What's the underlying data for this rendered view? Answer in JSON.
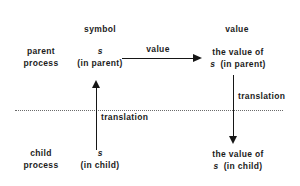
{
  "diagram": {
    "columns": {
      "symbol_header": "symbol",
      "value_header": "value"
    },
    "rows": {
      "parent_label_line1": "parent",
      "parent_label_line2": "process",
      "child_label_line1": "child",
      "child_label_line2": "process"
    },
    "nodes": {
      "parent_symbol_name": "s",
      "parent_symbol_scope": "(in parent)",
      "parent_value_line1": "the value of",
      "parent_value_name": "s",
      "parent_value_scope": "(in parent)",
      "child_symbol_name": "s",
      "child_symbol_scope": "(in child)",
      "child_value_line1": "the value of",
      "child_value_name": "s",
      "child_value_scope": "(in child)"
    },
    "edges": {
      "value_arrow_label": "value",
      "left_translation_label": "translation",
      "right_translation_label": "translation"
    },
    "colors": {
      "ink": "#161616",
      "divider": "#6a6a6a",
      "background": "#ffffff"
    }
  }
}
